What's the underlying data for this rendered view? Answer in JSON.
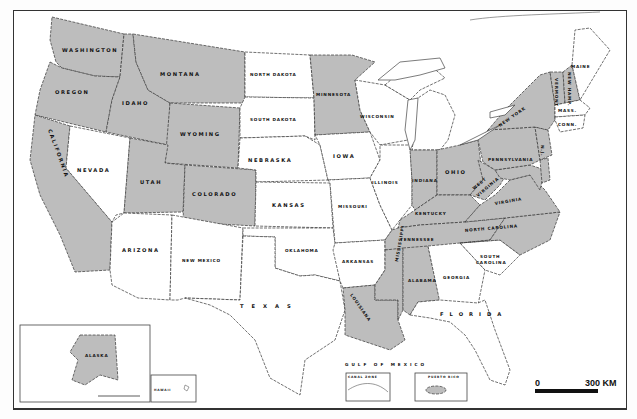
{
  "map": {
    "title": "",
    "shaded_color": "#bdbdbd",
    "unshaded_color": "#ffffff",
    "states": {
      "washington": {
        "label": "WASHINGTON",
        "shaded": true
      },
      "oregon": {
        "label": "OREGON",
        "shaded": true
      },
      "california": {
        "label": "CALIFORNIA",
        "shaded": true
      },
      "idaho": {
        "label": "IDAHO",
        "shaded": true
      },
      "nevada": {
        "label": "NEVADA",
        "shaded": false
      },
      "montana": {
        "label": "MONTANA",
        "shaded": true
      },
      "wyoming": {
        "label": "WYOMING",
        "shaded": true
      },
      "utah": {
        "label": "UTAH",
        "shaded": true
      },
      "colorado": {
        "label": "COLORADO",
        "shaded": true
      },
      "arizona": {
        "label": "ARIZONA",
        "shaded": false
      },
      "new_mexico": {
        "label": "NEW MEXICO",
        "shaded": false
      },
      "north_dakota": {
        "label": "NORTH DAKOTA",
        "shaded": false
      },
      "south_dakota": {
        "label": "SOUTH DAKOTA",
        "shaded": false
      },
      "nebraska": {
        "label": "NEBRASKA",
        "shaded": false
      },
      "kansas": {
        "label": "KANSAS",
        "shaded": false
      },
      "oklahoma": {
        "label": "OKLAHOMA",
        "shaded": false
      },
      "texas": {
        "label": "TEXAS",
        "shaded": false
      },
      "minnesota": {
        "label": "MINNESOTA",
        "shaded": true
      },
      "iowa": {
        "label": "IOWA",
        "shaded": false
      },
      "missouri": {
        "label": "MISSOURI",
        "shaded": false
      },
      "arkansas": {
        "label": "ARKANSAS",
        "shaded": false
      },
      "louisiana": {
        "label": "LOUISIANA",
        "shaded": true
      },
      "wisconsin": {
        "label": "WISCONSIN",
        "shaded": false
      },
      "illinois": {
        "label": "ILLINOIS",
        "shaded": false
      },
      "michigan": {
        "label": "MICHIGAN",
        "shaded": false
      },
      "indiana": {
        "label": "INDIANA",
        "shaded": true
      },
      "ohio": {
        "label": "OHIO",
        "shaded": true
      },
      "kentucky": {
        "label": "KENTUCKY",
        "shaded": true
      },
      "tennessee": {
        "label": "TENNESSEE",
        "shaded": true
      },
      "mississippi": {
        "label": "MISSISSIPPI",
        "shaded": true
      },
      "alabama": {
        "label": "ALABAMA",
        "shaded": true
      },
      "georgia": {
        "label": "GEORGIA",
        "shaded": false
      },
      "florida": {
        "label": "FLORIDA",
        "shaded": false
      },
      "south_carolina": {
        "label_line1": "SOUTH",
        "label_line2": "CAROLINA",
        "shaded": false
      },
      "north_carolina": {
        "label": "NORTH CAROLINA",
        "shaded": true
      },
      "virginia": {
        "label": "VIRGINIA",
        "shaded": true
      },
      "west_virginia": {
        "label_line1": "WEST",
        "label_line2": "VIRGINIA",
        "shaded": true
      },
      "maryland": {
        "label": "MD",
        "shaded": true
      },
      "delaware": {
        "label": "DEL",
        "shaded": true
      },
      "pennsylvania": {
        "label": "PENNSYLVANIA",
        "shaded": true
      },
      "new_jersey": {
        "label": "N.J.",
        "shaded": true
      },
      "new_york": {
        "label": "NEW YORK",
        "shaded": true
      },
      "vermont": {
        "label": "VERMONT",
        "shaded": true
      },
      "new_hampshire": {
        "label": "NEW HAMP.",
        "shaded": true
      },
      "massachusetts": {
        "label": "MASS.",
        "shaded": false
      },
      "connecticut": {
        "label": "CONN.",
        "shaded": false
      },
      "maine": {
        "label": "MAINE",
        "shaded": false
      },
      "alaska": {
        "label": "ALASKA",
        "shaded": true
      }
    },
    "water_labels": {
      "gulf": "GULF OF MEXICO"
    },
    "insets": {
      "alaska": {
        "label": "ALASKA"
      },
      "hawaii": {
        "label": "HAWAII"
      },
      "canal_zone": {
        "label": "CANAL ZONE"
      },
      "puerto_rico": {
        "label": "PUERTO RICO"
      }
    },
    "scale_bar": {
      "start": "0",
      "end": "300 KM"
    }
  }
}
